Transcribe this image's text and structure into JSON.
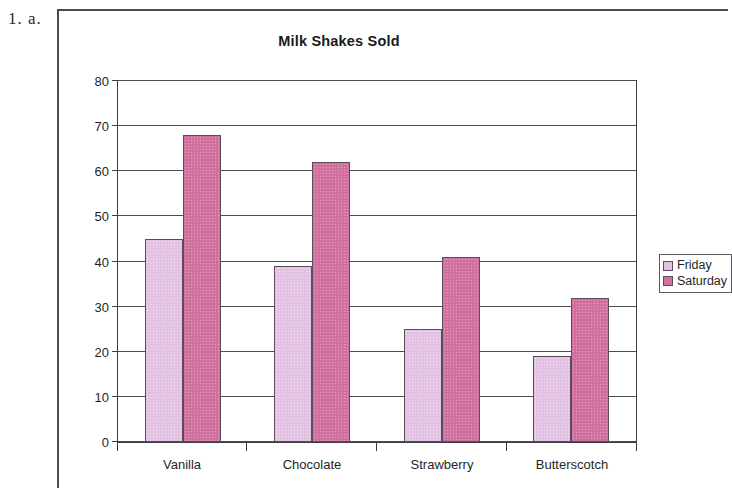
{
  "worksheet": {
    "item_number": "1. a."
  },
  "legend": {
    "position": "right",
    "entries": [
      {
        "label": "Friday",
        "color": "#e2c1e3",
        "icon": "legend-swatch-icon"
      },
      {
        "label": "Saturday",
        "color": "#d0709f",
        "icon": "legend-swatch-icon"
      }
    ]
  },
  "chart_data": {
    "type": "bar",
    "title": "Milk Shakes Sold",
    "xlabel": "",
    "ylabel": "How Many Milk Shakes",
    "ylim": [
      0,
      80
    ],
    "ytick_step": 10,
    "yticks": [
      80,
      70,
      60,
      50,
      40,
      30,
      20,
      10,
      0
    ],
    "grid": true,
    "categories": [
      "Vanilla",
      "Chocolate",
      "Strawberry",
      "Butterscotch"
    ],
    "series": [
      {
        "name": "Friday",
        "color": "#e2c1e3",
        "values": [
          45,
          39,
          25,
          19
        ]
      },
      {
        "name": "Saturday",
        "color": "#d0709f",
        "values": [
          68,
          62,
          41,
          32
        ]
      }
    ]
  }
}
